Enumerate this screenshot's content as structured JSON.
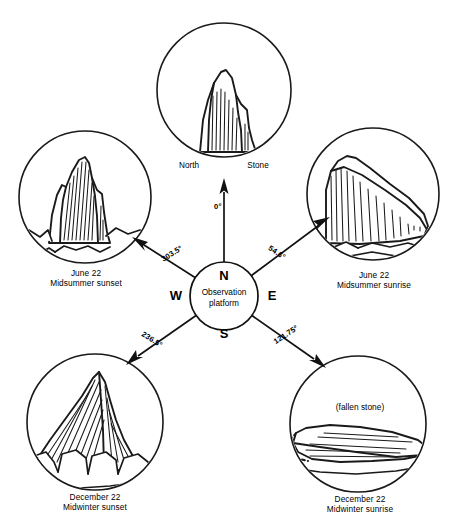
{
  "diagram": {
    "hub": {
      "label_line1": "Observation",
      "label_line2": "platform",
      "name": "observation-platform"
    },
    "compass": {
      "north": "N",
      "east": "E",
      "south": "S",
      "west": "W"
    },
    "north_marker": {
      "angle": "0°",
      "label_left": "North",
      "label_right": "Stone"
    },
    "sightlines": [
      {
        "id": "north",
        "angle": "0°",
        "target": "North Stone"
      },
      {
        "id": "midsummer-sunrise",
        "angle": "54.6°",
        "target": "June 22 Midsummer sunrise"
      },
      {
        "id": "midwinter-sunrise",
        "angle": "121.75°",
        "target": "December 22 Midwinter sunrise"
      },
      {
        "id": "midwinter-sunset",
        "angle": "236.5°",
        "target": "December 22 Midwinter sunset"
      },
      {
        "id": "midsummer-sunset",
        "angle": "303.5°",
        "target": "June 22 Midsummer sunset"
      }
    ],
    "views": [
      {
        "id": "north-stone",
        "position": "top-center",
        "caption_line1": "North",
        "caption_line2": "Stone",
        "note": ""
      },
      {
        "id": "midsummer-sunset",
        "position": "left-upper",
        "caption_line1": "June 22",
        "caption_line2": "Midsummer sunset",
        "note": ""
      },
      {
        "id": "midsummer-sunrise",
        "position": "right-upper",
        "caption_line1": "June 22",
        "caption_line2": "Midsummer sunrise",
        "note": ""
      },
      {
        "id": "midwinter-sunset",
        "position": "left-lower",
        "caption_line1": "December 22",
        "caption_line2": "Midwinter sunset",
        "note": ""
      },
      {
        "id": "midwinter-sunrise",
        "position": "right-lower",
        "caption_line1": "December 22",
        "caption_line2": "Midwinter sunrise",
        "note": "(fallen stone)"
      }
    ],
    "colors": {
      "ink": "#1a1a1a",
      "background": "#ffffff"
    }
  }
}
